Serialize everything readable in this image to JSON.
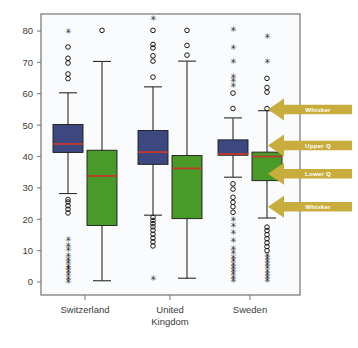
{
  "chart_data": {
    "type": "box",
    "title": "",
    "xlabel": "",
    "ylabel": "",
    "ylim": [
      -2,
      84
    ],
    "grid": false,
    "legend": "none",
    "yticks": [
      0,
      10,
      20,
      30,
      40,
      50,
      60,
      70,
      80
    ],
    "ytick_labels": [
      "0",
      "10",
      "20",
      "30",
      "40",
      "50",
      "60",
      "70",
      "80"
    ],
    "categories": [
      "Switzerland",
      "United Kingdom",
      "Sweden"
    ],
    "category_label_lines": [
      [
        "Switzerland"
      ],
      [
        "United",
        "Kingdom"
      ],
      [
        "Sweden"
      ]
    ],
    "series": [
      {
        "name": "blue",
        "color": "#3d4880",
        "median_color": "#c0392b",
        "boxes": [
          {
            "category": "Switzerland",
            "lower_whisker": 28.2,
            "lower_q": 41.3,
            "median": 44.0,
            "upper_q": 50.2,
            "upper_whisker": 60.3,
            "outliers_circle": [
              64.8,
              66.3,
              69.8,
              71.3,
              74.9
            ],
            "outliers_star": [
              80.0
            ],
            "low_outliers_circle": [
              22.0,
              23.2,
              24.3,
              25.5,
              26.3
            ],
            "low_outliers_star": [
              0.3,
              1.2,
              2.3,
              3.3,
              4.2,
              5.0,
              6.2,
              7.3,
              8.4,
              10.3,
              11.8,
              13.6
            ]
          },
          {
            "category": "United Kingdom",
            "lower_whisker": 21.3,
            "lower_q": 37.5,
            "median": 41.4,
            "upper_q": 48.3,
            "upper_whisker": 62.2,
            "outliers_circle": [
              65.3,
              70.4,
              72.1,
              74.6,
              75.7,
              80.2
            ],
            "outliers_star": [
              84.0
            ],
            "low_outliers_circle": [
              11.5,
              12.8,
              14.0,
              15.2,
              16.5,
              17.6,
              18.6,
              19.6,
              20.6
            ],
            "low_outliers_star": [
              1.1
            ]
          },
          {
            "category": "Sweden",
            "lower_whisker": 33.4,
            "lower_q": 40.4,
            "median": 40.8,
            "upper_q": 45.3,
            "upper_whisker": 52.3,
            "outliers_circle": [
              55.3,
              60.2
            ],
            "outliers_star": [
              62.8,
              64.4,
              65.5,
              70.3,
              74.7,
              80.4
            ],
            "low_outliers_circle": [
              22.2,
              24.0,
              25.4,
              27.0,
              29.6,
              31.3
            ],
            "low_outliers_star": [
              0.4,
              1.5,
              2.6,
              3.6,
              4.6,
              5.6,
              6.8,
              8.0,
              9.3,
              10.6,
              13.3,
              15.8,
              18.0,
              19.8
            ]
          }
        ]
      },
      {
        "name": "green",
        "color": "#4a9a2a",
        "median_color": "#c0392b",
        "boxes": [
          {
            "category": "Switzerland",
            "lower_whisker": 0.4,
            "lower_q": 18.0,
            "median": 33.8,
            "upper_q": 42.0,
            "upper_whisker": 70.3,
            "outliers_circle": [
              80.2
            ],
            "outliers_star": [],
            "low_outliers_circle": [],
            "low_outliers_star": []
          },
          {
            "category": "United Kingdom",
            "lower_whisker": 1.2,
            "lower_q": 20.2,
            "median": 36.2,
            "upper_q": 40.3,
            "upper_whisker": 70.4,
            "outliers_circle": [
              72.3,
              75.4,
              80.2
            ],
            "outliers_star": [],
            "low_outliers_circle": [],
            "low_outliers_star": []
          },
          {
            "category": "Sweden",
            "lower_whisker": 20.4,
            "lower_q": 32.3,
            "median": 40.0,
            "upper_q": 41.4,
            "upper_whisker": 54.6,
            "outliers_circle": [
              55.3,
              60.5,
              62.0,
              64.9
            ],
            "outliers_star": [
              70.3,
              78.4
            ],
            "low_outliers_circle": [
              10.0,
              11.3,
              12.5,
              13.8,
              15.1,
              16.4,
              17.5
            ],
            "low_outliers_star": [
              0.4,
              1.4,
              2.5,
              3.5,
              4.5,
              5.5,
              6.5,
              7.5,
              8.6
            ]
          }
        ]
      }
    ],
    "annotations": [
      {
        "id": "whisker-upper",
        "label": "Whisker",
        "value": 55.0
      },
      {
        "id": "upper-quartile",
        "label": "Upper Q",
        "value": 43.5
      },
      {
        "id": "lower-quartile",
        "label": "Lower Q",
        "value": 34.5
      },
      {
        "id": "whisker-lower",
        "label": "Whisker",
        "value": 24.0
      }
    ],
    "annotation_color": "#c8ad3c",
    "axis_color": "#7d7d7d",
    "plot_background": "#fafbfc"
  }
}
